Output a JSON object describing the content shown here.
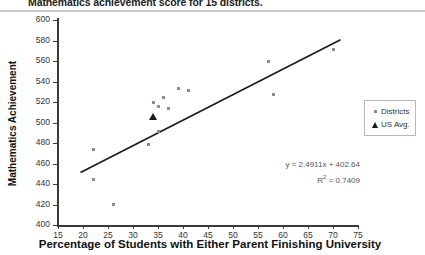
{
  "chart_data": {
    "type": "scatter",
    "title": "Mathematics achievement score for 15 districts.",
    "xlabel": "Percentage of Students with Either Parent Finishing University",
    "ylabel": "Mathematics Achievement",
    "xlim": [
      15,
      75
    ],
    "ylim": [
      400,
      600
    ],
    "xticks": [
      15,
      20,
      25,
      30,
      35,
      40,
      45,
      50,
      55,
      60,
      65,
      70,
      75
    ],
    "yticks": [
      400,
      420,
      440,
      460,
      480,
      500,
      520,
      540,
      560,
      580,
      600
    ],
    "grid": false,
    "legend_position": "right",
    "series": [
      {
        "name": "Districts",
        "marker": "square",
        "color": "#8a8a96",
        "points": [
          {
            "x": 22,
            "y": 444
          },
          {
            "x": 22,
            "y": 474
          },
          {
            "x": 26,
            "y": 420
          },
          {
            "x": 33,
            "y": 479
          },
          {
            "x": 34,
            "y": 520
          },
          {
            "x": 35,
            "y": 516
          },
          {
            "x": 35,
            "y": 491
          },
          {
            "x": 36,
            "y": 524
          },
          {
            "x": 37,
            "y": 514
          },
          {
            "x": 39,
            "y": 533
          },
          {
            "x": 41,
            "y": 531
          },
          {
            "x": 57,
            "y": 560
          },
          {
            "x": 58,
            "y": 527
          },
          {
            "x": 70,
            "y": 571
          }
        ]
      },
      {
        "name": "US Avg.",
        "marker": "triangle",
        "color": "#1a1a1a",
        "points": [
          {
            "x": 34,
            "y": 505
          }
        ]
      }
    ],
    "trendline": {
      "slope": 2.4911,
      "intercept": 402.64,
      "r_squared": 0.7409,
      "equation_label": "y = 2.4911x + 402.64",
      "r2_label": "R² = 0.7409",
      "x_start": 19.5,
      "x_end": 71.5,
      "color": "#1a1a1a"
    }
  },
  "legend": {
    "items": [
      {
        "label": "Districts",
        "marker": "square"
      },
      {
        "label": "US Avg.",
        "marker": "triangle"
      }
    ]
  },
  "equation": {
    "line1": "y = 2.4911x + 402.64",
    "line2_prefix": "R",
    "line2_sup": "2",
    "line2_suffix": " = 0.7409"
  }
}
